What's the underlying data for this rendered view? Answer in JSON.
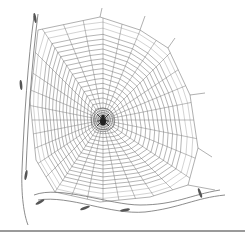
{
  "figure": {
    "caption": "Orb spider web illustration"
  },
  "colors": {
    "background": "#ffffff",
    "line": "#6e6e6e",
    "ink": "#222222",
    "rule": "#9a9a9a"
  },
  "web": {
    "hub": [
      103,
      120
    ],
    "radials": 32,
    "spiral_turns": 16,
    "spiral_inner": 12,
    "frame": [
      [
        38,
        30
      ],
      [
        100,
        17
      ],
      [
        140,
        30
      ],
      [
        168,
        48
      ],
      [
        190,
        95
      ],
      [
        198,
        148
      ],
      [
        188,
        185
      ],
      [
        150,
        197
      ],
      [
        100,
        202
      ],
      [
        55,
        192
      ],
      [
        36,
        160
      ],
      [
        30,
        100
      ]
    ],
    "anchors": [
      [
        [
          100,
          17
        ],
        [
          102,
          8
        ]
      ],
      [
        [
          140,
          30
        ],
        [
          145,
          16
        ]
      ],
      [
        [
          168,
          48
        ],
        [
          175,
          38
        ]
      ],
      [
        [
          190,
          95
        ],
        [
          205,
          93
        ]
      ],
      [
        [
          198,
          148
        ],
        [
          212,
          157
        ]
      ],
      [
        [
          188,
          185
        ],
        [
          215,
          190
        ]
      ]
    ]
  },
  "spider": {
    "label": "spider"
  },
  "stems": [
    {
      "d": "M34 16 C28 60, 24 120, 22 170 C21 195, 24 215, 28 225"
    },
    {
      "d": "M38 14 C32 60, 28 120, 26 170"
    },
    {
      "d": "M34 195 C60 185, 110 205, 140 205 C175 205, 190 195, 220 190"
    },
    {
      "d": "M38 200 C70 195, 110 215, 145 212 C180 208, 195 198, 225 195"
    }
  ]
}
